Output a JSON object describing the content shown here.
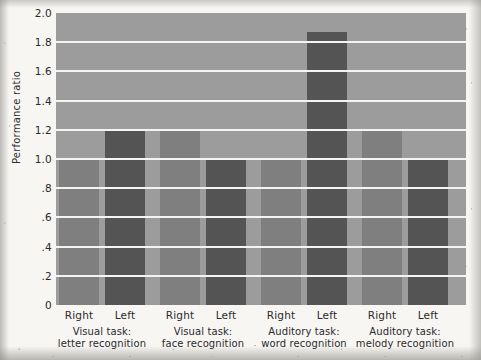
{
  "chart_data": {
    "type": "bar",
    "title": "",
    "xlabel": "",
    "ylabel": "Performance ratio",
    "ylim": [
      0,
      2.0
    ],
    "ytick_labels": [
      "2.0",
      "1.8",
      "1.6",
      "1.4",
      "1.2",
      "1.0",
      ".8",
      ".6",
      ".4",
      ".2",
      "0"
    ],
    "ytick_values": [
      2.0,
      1.8,
      1.6,
      1.4,
      1.2,
      1.0,
      0.8,
      0.6,
      0.4,
      0.2,
      0
    ],
    "grid": "horizontal",
    "legend": "none",
    "categories": [
      "Visual task: letter recognition",
      "Visual task: face recognition",
      "Auditory task: word recognition",
      "Auditory task: melody recognition"
    ],
    "series": [
      {
        "name": "Right",
        "values": [
          1.0,
          1.2,
          1.0,
          1.2
        ]
      },
      {
        "name": "Left",
        "values": [
          1.2,
          1.0,
          1.87,
          1.0
        ]
      }
    ],
    "bar_colors": {
      "Right": "#7f7f7f",
      "Left": "#545454"
    },
    "plot_background": "#9c9c9c",
    "gridline_color": "#f4f4f2"
  },
  "axis": {
    "y_title": "Performance ratio",
    "ticks": [
      {
        "label": "2.0",
        "value": 2.0
      },
      {
        "label": "1.8",
        "value": 1.8
      },
      {
        "label": "1.6",
        "value": 1.6
      },
      {
        "label": "1.4",
        "value": 1.4
      },
      {
        "label": "1.2",
        "value": 1.2
      },
      {
        "label": "1.0",
        "value": 1.0
      },
      {
        "label": ".8",
        "value": 0.8
      },
      {
        "label": ".6",
        "value": 0.6
      },
      {
        "label": ".4",
        "value": 0.4
      },
      {
        "label": ".2",
        "value": 0.2
      },
      {
        "label": "0",
        "value": 0.0
      }
    ]
  },
  "groups": [
    {
      "line1": "Visual task:",
      "line2": "letter recognition",
      "bars": [
        {
          "side": "Right",
          "value": 1.0
        },
        {
          "side": "Left",
          "value": 1.2
        }
      ]
    },
    {
      "line1": "Visual task:",
      "line2": "face recognition",
      "bars": [
        {
          "side": "Right",
          "value": 1.2
        },
        {
          "side": "Left",
          "value": 1.0
        }
      ]
    },
    {
      "line1": "Auditory task:",
      "line2": "word recognition",
      "bars": [
        {
          "side": "Right",
          "value": 1.0
        },
        {
          "side": "Left",
          "value": 1.87
        }
      ]
    },
    {
      "line1": "Auditory task:",
      "line2": "melody recognition",
      "bars": [
        {
          "side": "Right",
          "value": 1.2
        },
        {
          "side": "Left",
          "value": 1.0
        }
      ]
    }
  ]
}
